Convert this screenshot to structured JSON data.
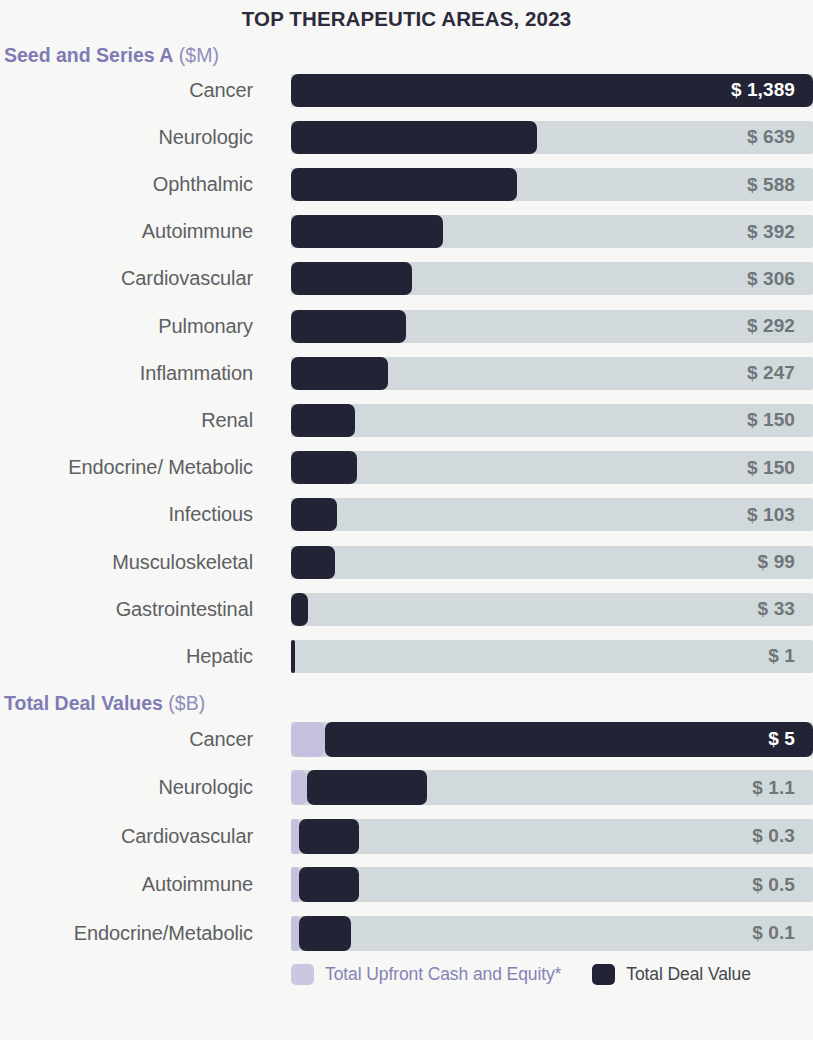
{
  "chart_data": [
    {
      "type": "bar",
      "title": "Seed and Series A",
      "unit": "($M)",
      "currency_prefix": "$",
      "xlabel": "",
      "ylabel": "",
      "orientation": "horizontal",
      "grid": false,
      "xlim": [
        0,
        1389
      ],
      "max_value": 1389,
      "categories": [
        "Cancer",
        "Neurologic",
        "Ophthalmic",
        "Autoimmune",
        "Cardiovascular",
        "Pulmonary",
        "Inflammation",
        "Renal",
        "Endocrine/ Metabolic",
        "Infectious",
        "Musculoskeletal",
        "Gastrointestinal",
        "Hepatic"
      ],
      "values": [
        1389,
        639,
        588,
        392,
        306,
        292,
        247,
        150,
        150,
        103,
        99,
        33,
        1
      ],
      "value_labels": [
        "$ 1,389",
        "$ 639",
        "$ 588",
        "$ 392",
        "$ 306",
        "$ 292",
        "$ 247",
        "$ 150",
        "$ 150",
        "$ 103",
        "$ 99",
        "$ 33",
        "$ 1"
      ]
    },
    {
      "type": "bar",
      "title": "Total Deal Values",
      "unit": "($B)",
      "currency_prefix": "$",
      "xlabel": "",
      "ylabel": "",
      "orientation": "horizontal",
      "grid": false,
      "xlim": [
        0,
        5
      ],
      "max_value": 5,
      "categories": [
        "Cancer",
        "Neurologic",
        "Cardiovascular",
        "Autoimmune",
        "Endocrine/Metabolic"
      ],
      "series": [
        {
          "name": "Total Upfront Cash and Equity*",
          "values": [
            0.6,
            0.25,
            0.1,
            0.1,
            0.1
          ]
        },
        {
          "name": "Total Deal Value",
          "values": [
            5,
            1.1,
            0.3,
            0.5,
            0.1
          ]
        }
      ],
      "values": [
        5,
        1.1,
        0.3,
        0.5,
        0.1
      ],
      "value_labels": [
        "$ 5",
        "$ 1.1",
        "$ 0.3",
        "$ 0.5",
        "$ 0.1"
      ],
      "legend": [
        {
          "label": "Total Upfront Cash and Equity*",
          "color": "#c9c7e2"
        },
        {
          "label": "Total Deal Value",
          "color": "#232336"
        }
      ],
      "legend_position": "bottom"
    }
  ],
  "header": {
    "title": "TOP THERAPEUTIC AREAS, 2023"
  },
  "section1": {
    "title": "Seed and Series A",
    "unit": " ($M)",
    "rows": [
      {
        "label": "Cancer",
        "value": "$ 1,389",
        "bar_pct": 100.0,
        "on_dark": true
      },
      {
        "label": "Neurologic",
        "value": "$ 639",
        "bar_pct": 47.1,
        "on_dark": false
      },
      {
        "label": "Ophthalmic",
        "value": "$ 588",
        "bar_pct": 43.3,
        "on_dark": false
      },
      {
        "label": "Autoimmune",
        "value": "$ 392",
        "bar_pct": 29.1,
        "on_dark": false
      },
      {
        "label": "Cardiovascular",
        "value": "$ 306",
        "bar_pct": 23.2,
        "on_dark": false
      },
      {
        "label": "Pulmonary",
        "value": "$ 292",
        "bar_pct": 22.0,
        "on_dark": false
      },
      {
        "label": "Inflammation",
        "value": "$ 247",
        "bar_pct": 18.6,
        "on_dark": false
      },
      {
        "label": "Renal",
        "value": "$ 150",
        "bar_pct": 12.2,
        "on_dark": false
      },
      {
        "label": "Endocrine/ Metabolic",
        "value": "$ 150",
        "bar_pct": 12.6,
        "on_dark": false
      },
      {
        "label": "Infectious",
        "value": "$ 103",
        "bar_pct": 8.8,
        "on_dark": false
      },
      {
        "label": "Musculoskeletal",
        "value": "$ 99",
        "bar_pct": 8.4,
        "on_dark": false
      },
      {
        "label": "Gastrointestinal",
        "value": "$ 33",
        "bar_pct": 3.3,
        "on_dark": false
      },
      {
        "label": "Hepatic",
        "value": "$ 1",
        "bar_pct": 0.7,
        "on_dark": false
      }
    ]
  },
  "section2": {
    "title": "Total Deal Values",
    "unit": " ($B)",
    "rows": [
      {
        "label": "Cancer",
        "value": "$ 5",
        "bar_pct": 100.0,
        "upfront_pct": 6.5,
        "on_dark": true
      },
      {
        "label": "Neurologic",
        "value": "$ 1.1",
        "bar_pct": 26.0,
        "upfront_pct": 3.0,
        "on_dark": false
      },
      {
        "label": "Cardiovascular",
        "value": "$ 0.3",
        "bar_pct": 13.0,
        "upfront_pct": 1.5,
        "on_dark": false
      },
      {
        "label": "Autoimmune",
        "value": "$ 0.5",
        "bar_pct": 13.0,
        "upfront_pct": 1.5,
        "on_dark": false
      },
      {
        "label": "Endocrine/Metabolic",
        "value": "$ 0.1",
        "bar_pct": 11.5,
        "upfront_pct": 1.5,
        "on_dark": false
      }
    ]
  },
  "legend": {
    "items": [
      {
        "label": "Total Upfront Cash and Equity*",
        "color": "#c9c7e2",
        "style": "purple"
      },
      {
        "label": "Total Deal Value",
        "color": "#232336",
        "style": "dark"
      }
    ]
  },
  "colors": {
    "background": "#f7f7f5",
    "title": "#2b2b3d",
    "section_heading": "#7e7bb5",
    "bar_dark": "#232336",
    "bar_upfront": "#c4c2de",
    "track": "#d2d9dd",
    "row_label": "#5d5f63",
    "value_label": "#70757a",
    "value_label_on_dark": "#ffffff"
  }
}
